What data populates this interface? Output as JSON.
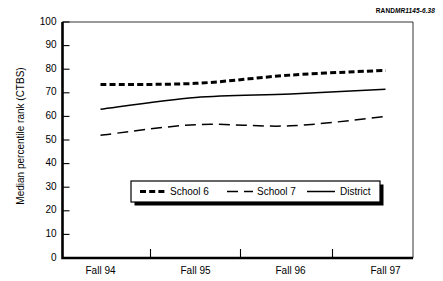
{
  "figure_id": {
    "prefix": "RAND",
    "number": "MR1145-6.38"
  },
  "chart_data": {
    "type": "line",
    "title": "",
    "subtitle": "",
    "xlabel": "",
    "ylabel": "Median percentile rank (CTBS)",
    "categories": [
      "Fall 94",
      "Fall 95",
      "Fall 96",
      "Fall 97"
    ],
    "ylim": [
      0,
      100
    ],
    "y_ticks": [
      0,
      10,
      20,
      30,
      40,
      50,
      60,
      70,
      80,
      90,
      100
    ],
    "grid": false,
    "legend_position": "lower-center-inside",
    "series": [
      {
        "name": "School 6",
        "values": [
          73.5,
          74.0,
          77.5,
          79.5
        ],
        "style": "thick-dashed",
        "color": "#000000"
      },
      {
        "name": "School 7",
        "values": [
          52.0,
          56.5,
          56.0,
          60.0
        ],
        "style": "long-dashed",
        "color": "#000000"
      },
      {
        "name": "District",
        "values": [
          63.0,
          68.0,
          69.5,
          71.5
        ],
        "style": "solid",
        "color": "#000000"
      }
    ]
  }
}
